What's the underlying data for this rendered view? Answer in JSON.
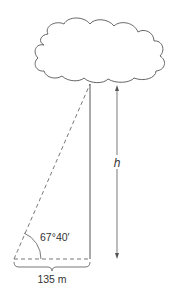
{
  "diagram": {
    "angle_label": "67°40′",
    "base_label": "135 m",
    "height_label": "h",
    "colors": {
      "stroke": "#555555",
      "text": "#333333",
      "background": "#ffffff"
    }
  }
}
